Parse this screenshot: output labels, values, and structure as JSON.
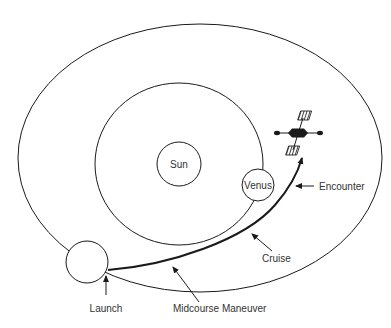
{
  "diagram": {
    "type": "orbital-trajectory",
    "bodies": {
      "sun": {
        "label": "Sun"
      },
      "venus": {
        "label": "Venus"
      },
      "earth": {
        "label": ""
      }
    },
    "orbits": [
      "Earth orbit",
      "Venus orbit"
    ],
    "annotations": {
      "launch": "Launch",
      "midcourse": "Midcourse Maneuver",
      "cruise": "Cruise",
      "encounter": "Encounter"
    },
    "icons": {
      "spacecraft": "spacecraft-icon"
    },
    "colors": {
      "line": "#1a1a1a",
      "text": "#333333",
      "background": "#ffffff"
    }
  }
}
